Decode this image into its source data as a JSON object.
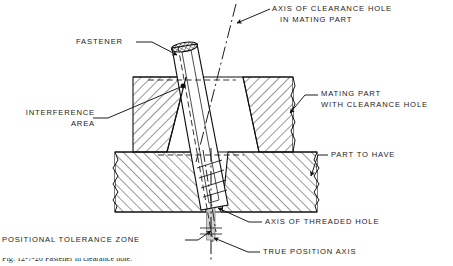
{
  "figure": {
    "type": "engineering-section-diagram",
    "background_color": "#ffffff",
    "line_color": "#111111",
    "hatch_color": "#1b1b1b",
    "tolerance_zone_fill": "#c9c9c9"
  },
  "labels": {
    "axis_clearance_hole": {
      "line1": "AXIS OF CLEARANCE HOLE",
      "line2": "IN MATING PART"
    },
    "fastener": "FASTENER",
    "interference_area": {
      "line1": "INTERFERENCE",
      "line2": "AREA"
    },
    "mating_part": {
      "line1": "MATING PART",
      "line2": "WITH CLEARANCE HOLE"
    },
    "part_to_have": "PART TO HAVE",
    "axis_threaded_hole": "AXIS OF THREADED HOLE",
    "positional_tolerance_zone": "POSITIONAL TOLERANCE ZONE",
    "true_position_axis": "TRUE POSITION AXIS"
  },
  "caption": {
    "text": "Fig. 12-7-26  Fastener in clearance hole."
  },
  "geometry": {
    "mating_part": {
      "left": 133,
      "right": 293,
      "top": 77,
      "bottom": 152
    },
    "lower_part": {
      "left": 115,
      "right": 317,
      "top": 152,
      "bottom": 212
    },
    "tolerance_zone": {
      "left": 207,
      "right": 215,
      "top": 152,
      "bottom": 240
    },
    "true_position_axis_x": 211
  }
}
